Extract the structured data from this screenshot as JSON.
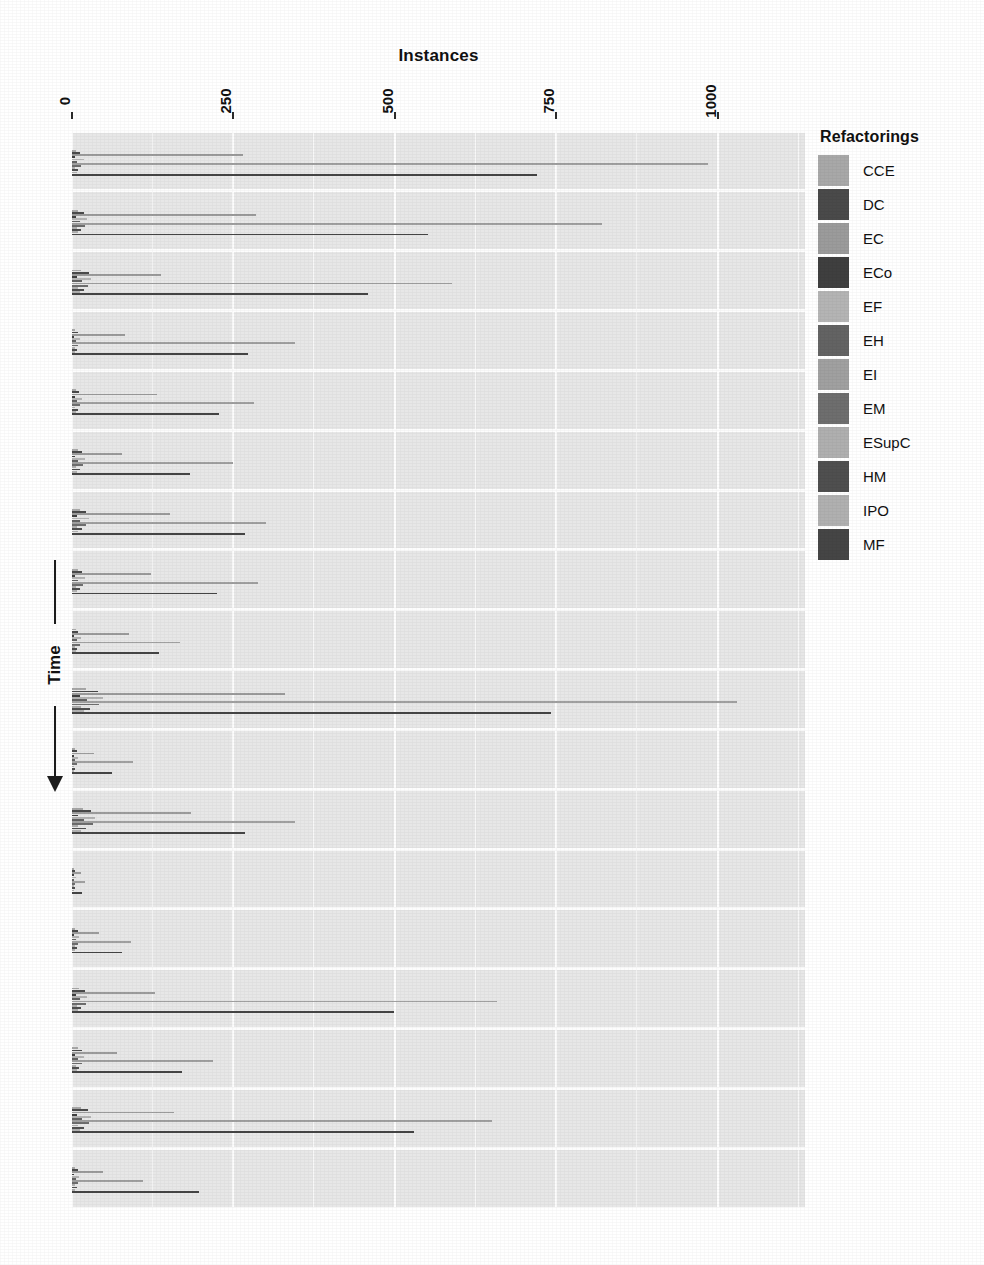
{
  "chart_data": {
    "type": "bar",
    "orientation": "horizontal",
    "title": "",
    "xlabel": "Instances",
    "ylabel": "Time",
    "xlim": [
      0,
      1135
    ],
    "ylim": null,
    "grid": true,
    "xticks": [
      0,
      250,
      500,
      750,
      1000
    ],
    "xticklabels": [
      "0",
      "250",
      "500",
      "750",
      "1000"
    ],
    "xaxis_position": "top",
    "xtick_label_rotation": -90,
    "yaxis_label_arrow": "down",
    "yticklabels": [],
    "legend": {
      "title": "Refactorings",
      "position": "right",
      "entries": [
        {
          "name": "CCE",
          "color": "#a8a8a8"
        },
        {
          "name": "DC",
          "color": "#4a4a4a"
        },
        {
          "name": "EC",
          "color": "#9b9b9b"
        },
        {
          "name": "ECo",
          "color": "#3f3f3f"
        },
        {
          "name": "EF",
          "color": "#b4b4b4"
        },
        {
          "name": "EH",
          "color": "#636363"
        },
        {
          "name": "EI",
          "color": "#a0a0a0"
        },
        {
          "name": "EM",
          "color": "#6e6e6e"
        },
        {
          "name": "ESupC",
          "color": "#afafaf"
        },
        {
          "name": "HM",
          "color": "#4f4f4f"
        },
        {
          "name": "IPO",
          "color": "#b0b0b0"
        },
        {
          "name": "MF",
          "color": "#454545"
        }
      ]
    },
    "categories": [
      "t1",
      "t2",
      "t3",
      "t4",
      "t5",
      "t6",
      "t7",
      "t8",
      "t9",
      "t10",
      "t11",
      "t12",
      "t13",
      "t14",
      "t15",
      "t16",
      "t17",
      "t18"
    ],
    "series": [
      {
        "name": "CCE",
        "values": [
          6,
          10,
          14,
          5,
          6,
          9,
          12,
          9,
          6,
          22,
          4,
          17,
          3,
          5,
          11,
          9,
          14,
          5
        ]
      },
      {
        "name": "DC",
        "values": [
          12,
          18,
          26,
          9,
          11,
          16,
          21,
          16,
          10,
          40,
          7,
          30,
          5,
          9,
          20,
          16,
          25,
          9
        ]
      },
      {
        "name": "EC",
        "values": [
          265,
          285,
          138,
          82,
          132,
          78,
          152,
          122,
          88,
          330,
          34,
          185,
          14,
          42,
          128,
          70,
          158,
          48
        ]
      },
      {
        "name": "ECo",
        "values": [
          4,
          6,
          8,
          3,
          4,
          5,
          7,
          5,
          3,
          12,
          2,
          9,
          2,
          3,
          6,
          5,
          8,
          3
        ]
      },
      {
        "name": "EF",
        "values": [
          18,
          24,
          30,
          12,
          16,
          20,
          26,
          20,
          14,
          48,
          9,
          36,
          6,
          11,
          24,
          19,
          30,
          11
        ]
      },
      {
        "name": "EH",
        "values": [
          8,
          12,
          15,
          6,
          8,
          10,
          13,
          10,
          7,
          24,
          4,
          18,
          3,
          6,
          12,
          9,
          15,
          6
        ]
      },
      {
        "name": "EI",
        "values": [
          985,
          820,
          588,
          345,
          282,
          250,
          300,
          288,
          168,
          1030,
          95,
          345,
          20,
          92,
          658,
          218,
          650,
          110
        ]
      },
      {
        "name": "EM",
        "values": [
          14,
          20,
          25,
          10,
          13,
          17,
          22,
          17,
          12,
          42,
          8,
          32,
          5,
          10,
          21,
          16,
          26,
          10
        ]
      },
      {
        "name": "ESupC",
        "values": [
          5,
          7,
          9,
          4,
          5,
          6,
          8,
          6,
          4,
          14,
          3,
          10,
          2,
          4,
          7,
          6,
          9,
          4
        ]
      },
      {
        "name": "HM",
        "values": [
          10,
          14,
          18,
          7,
          9,
          12,
          16,
          12,
          8,
          28,
          5,
          21,
          4,
          7,
          14,
          11,
          18,
          7
        ]
      },
      {
        "name": "IPO",
        "values": [
          7,
          9,
          12,
          5,
          6,
          8,
          10,
          8,
          6,
          19,
          3,
          14,
          3,
          5,
          10,
          7,
          12,
          5
        ]
      },
      {
        "name": "MF",
        "values": [
          720,
          552,
          458,
          272,
          228,
          182,
          268,
          225,
          135,
          742,
          62,
          268,
          16,
          78,
          498,
          170,
          530,
          196
        ]
      }
    ]
  }
}
